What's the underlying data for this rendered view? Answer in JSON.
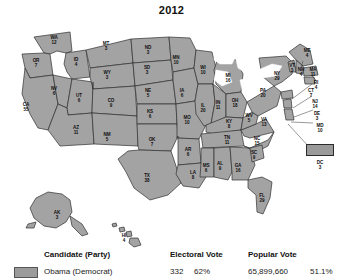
{
  "title": "2012",
  "map": {
    "name": "united-states-electoral-college-map",
    "fill_color": "#a3a3a3",
    "border_color": "#2f2f2f",
    "states": [
      {
        "abbr": "WA",
        "ev": "12",
        "x": 54,
        "y": 20
      },
      {
        "abbr": "OR",
        "ev": "7",
        "x": 36,
        "y": 43
      },
      {
        "abbr": "CA",
        "ev": "55",
        "x": 26,
        "y": 87
      },
      {
        "abbr": "NV",
        "ev": "6",
        "x": 54,
        "y": 71
      },
      {
        "abbr": "ID",
        "ev": "4",
        "x": 76,
        "y": 42
      },
      {
        "abbr": "MT",
        "ev": "3",
        "x": 106,
        "y": 26
      },
      {
        "abbr": "WY",
        "ev": "3",
        "x": 107,
        "y": 55
      },
      {
        "abbr": "UT",
        "ev": "6",
        "x": 79,
        "y": 78
      },
      {
        "abbr": "AZ",
        "ev": "11",
        "x": 76,
        "y": 110
      },
      {
        "abbr": "CO",
        "ev": "9",
        "x": 111,
        "y": 83
      },
      {
        "abbr": "NM",
        "ev": "5",
        "x": 107,
        "y": 117
      },
      {
        "abbr": "ND",
        "ev": "3",
        "x": 148,
        "y": 30
      },
      {
        "abbr": "SD",
        "ev": "3",
        "x": 147,
        "y": 50
      },
      {
        "abbr": "NE",
        "ev": "5",
        "x": 148,
        "y": 73
      },
      {
        "abbr": "KS",
        "ev": "6",
        "x": 150,
        "y": 94
      },
      {
        "abbr": "OK",
        "ev": "7",
        "x": 152,
        "y": 122
      },
      {
        "abbr": "TX",
        "ev": "38",
        "x": 147,
        "y": 158
      },
      {
        "abbr": "MN",
        "ev": "10",
        "x": 176,
        "y": 40
      },
      {
        "abbr": "IA",
        "ev": "6",
        "x": 182,
        "y": 73
      },
      {
        "abbr": "MO",
        "ev": "10",
        "x": 187,
        "y": 100
      },
      {
        "abbr": "AR",
        "ev": "6",
        "x": 188,
        "y": 132
      },
      {
        "abbr": "LA",
        "ev": "8",
        "x": 193,
        "y": 155
      },
      {
        "abbr": "WI",
        "ev": "10",
        "x": 203,
        "y": 50
      },
      {
        "abbr": "IL",
        "ev": "20",
        "x": 203,
        "y": 88
      },
      {
        "abbr": "MS",
        "ev": "6",
        "x": 206,
        "y": 148
      },
      {
        "abbr": "MI",
        "ev": "16",
        "x": 228,
        "y": 58
      },
      {
        "abbr": "IN",
        "ev": "11",
        "x": 218,
        "y": 85
      },
      {
        "abbr": "OH",
        "ev": "18",
        "x": 235,
        "y": 83
      },
      {
        "abbr": "KY",
        "ev": "8",
        "x": 229,
        "y": 104
      },
      {
        "abbr": "TN",
        "ev": "11",
        "x": 227,
        "y": 120
      },
      {
        "abbr": "AL",
        "ev": "9",
        "x": 220,
        "y": 146
      },
      {
        "abbr": "GA",
        "ev": "16",
        "x": 238,
        "y": 148
      },
      {
        "abbr": "FL",
        "ev": "29",
        "x": 262,
        "y": 178
      },
      {
        "abbr": "SC",
        "ev": "9",
        "x": 254,
        "y": 135
      },
      {
        "abbr": "NC",
        "ev": "15",
        "x": 257,
        "y": 121
      },
      {
        "abbr": "WV",
        "ev": "5",
        "x": 249,
        "y": 98
      },
      {
        "abbr": "VA",
        "ev": "13",
        "x": 264,
        "y": 102
      },
      {
        "abbr": "PA",
        "ev": "20",
        "x": 263,
        "y": 73
      },
      {
        "abbr": "NY",
        "ev": "29",
        "x": 277,
        "y": 56
      },
      {
        "abbr": "VT",
        "ev": "3",
        "x": 292,
        "y": 48
      },
      {
        "abbr": "NH",
        "ev": "4",
        "x": 301,
        "y": 52
      },
      {
        "abbr": "MA",
        "ev": "11",
        "x": 313,
        "y": 52
      },
      {
        "abbr": "ME",
        "ev": "4",
        "x": 307,
        "y": 33
      },
      {
        "abbr": "RI",
        "ev": "4",
        "x": 316,
        "y": 65
      },
      {
        "abbr": "CT",
        "ev": "7",
        "x": 311,
        "y": 73
      },
      {
        "abbr": "NJ",
        "ev": "14",
        "x": 315,
        "y": 84
      },
      {
        "abbr": "DE",
        "ev": "3",
        "x": 317,
        "y": 96
      },
      {
        "abbr": "MD",
        "ev": "10",
        "x": 320,
        "y": 108
      },
      {
        "abbr": "DC",
        "ev": "3",
        "x": 320,
        "y": 145
      },
      {
        "abbr": "AK",
        "ev": "3",
        "x": 57,
        "y": 195
      },
      {
        "abbr": "HI",
        "ev": "4",
        "x": 124,
        "y": 218
      }
    ]
  },
  "legend": {
    "headers": {
      "candidate": "Candidate (Party)",
      "electoral": "Electoral Vote",
      "popular": "Popular Vote"
    },
    "rows": [
      {
        "candidate": "Obama (Democrat)",
        "electoral_votes": "332",
        "electoral_pct": "62%",
        "popular_votes": "65,899,660",
        "popular_pct": "51.1%",
        "swatch_color": "#9b9b9b"
      }
    ]
  }
}
